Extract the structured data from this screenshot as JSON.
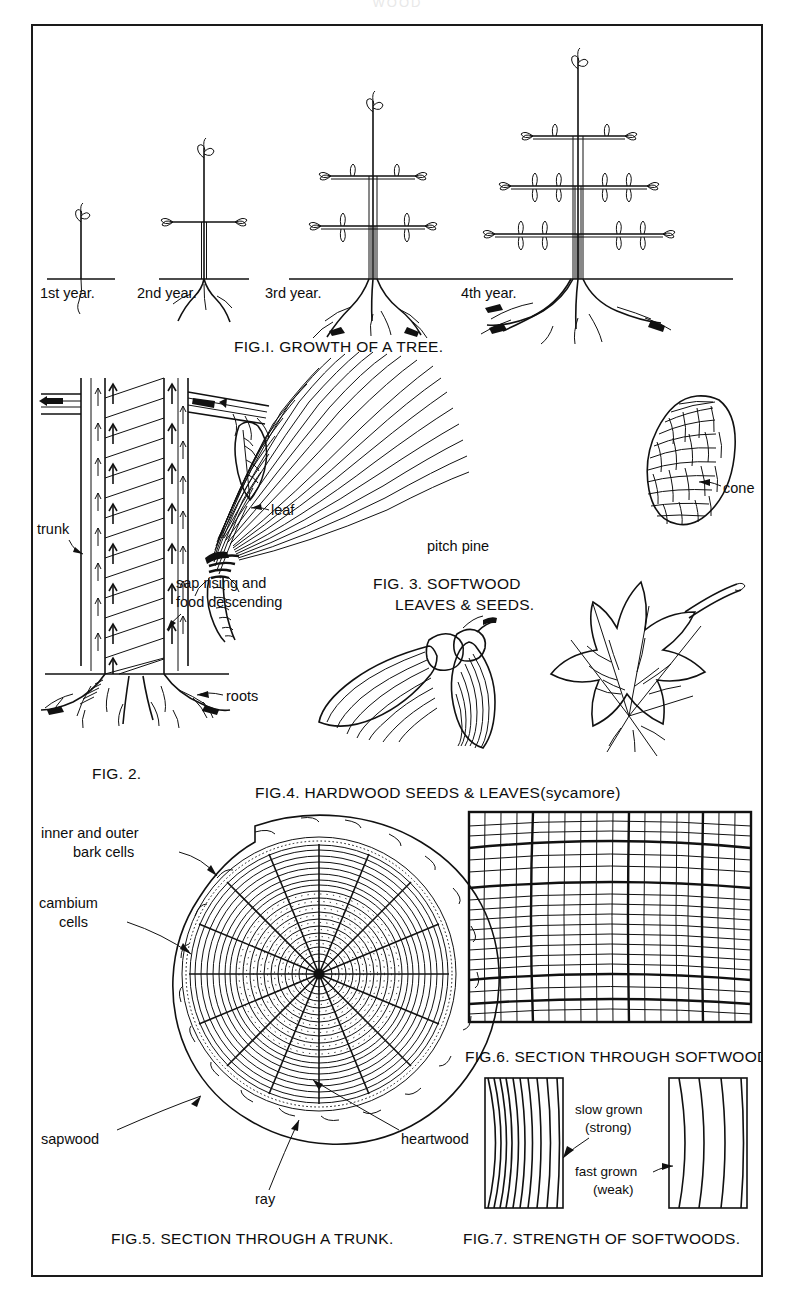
{
  "header": {
    "running_title": "WOOD"
  },
  "plate": {
    "figures": [
      {
        "id": "fig1",
        "caption": "FIG.I. GROWTH OF A TREE.",
        "stage_labels": [
          "1st year.",
          "2nd year.",
          "3rd year.",
          "4th year."
        ],
        "description": "Four saplings showing yearly growth increments"
      },
      {
        "id": "fig2",
        "caption": "FIG. 2.",
        "labels": [
          "trunk",
          "leaf",
          "sap rising and",
          "food descending",
          "roots"
        ],
        "description": "Longitudinal section of a trunk showing sap flow"
      },
      {
        "id": "fig3",
        "caption_line1": "FIG. 3. SOFTWOOD",
        "caption_line2": "LEAVES & SEEDS.",
        "labels": [
          "pitch pine",
          "cone"
        ],
        "description": "Pine needle cluster and cone"
      },
      {
        "id": "fig4",
        "caption": "FIG.4. HARDWOOD SEEDS & LEAVES(sycamore)",
        "description": "Sycamore winged seeds and palmate leaf"
      },
      {
        "id": "fig5",
        "caption": "FIG.5. SECTION THROUGH A TRUNK.",
        "labels": {
          "bark": "inner and outer",
          "bark2": "bark cells",
          "cambium": "cambium",
          "cambium2": "cells",
          "sapwood": "sapwood",
          "heartwood": "heartwood",
          "ray": "ray"
        },
        "description": "Cross-section of trunk with annual rings"
      },
      {
        "id": "fig6",
        "caption": "FIG.6. SECTION THROUGH SOFTWOOD",
        "description": "Magnified cell structure of softwood"
      },
      {
        "id": "fig7",
        "caption": "FIG.7. STRENGTH OF SOFTWOODS.",
        "labels": [
          "slow grown",
          "(strong)",
          "fast grown",
          "(weak)"
        ],
        "description": "Two wood samples comparing ring spacing"
      }
    ]
  },
  "colors": {
    "ink": "#111111",
    "paper": "#ffffff",
    "frame": "#1a1a1a"
  }
}
